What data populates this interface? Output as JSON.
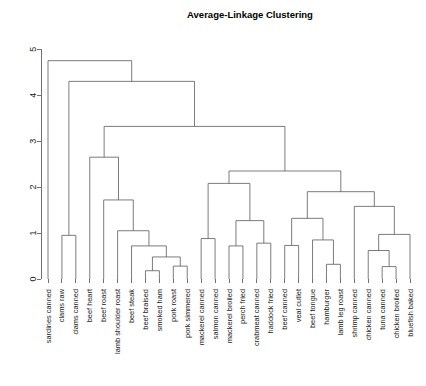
{
  "chart_data": {
    "type": "dendrogram",
    "title": "Average-Linkage Clustering",
    "xlabel": "",
    "ylabel": "",
    "ylim": [
      0,
      5.2
    ],
    "grid": false,
    "legend": "none",
    "y_ticks": [
      0,
      1,
      2,
      3,
      4,
      5
    ],
    "y_tick_labels": [
      "0",
      "1",
      "2",
      "3",
      "4",
      "5"
    ],
    "leaf_order": [
      "sardines canned",
      "clams raw",
      "clams canned",
      "beef heart",
      "beef roast",
      "lamb shoulder roast",
      "beef steak",
      "beef braised",
      "smoked ham",
      "pork roast",
      "pork simmered",
      "mackerel canned",
      "salmon canned",
      "mackerel broiled",
      "perch fried",
      "crabmeat canned",
      "haddock fried",
      "beef canned",
      "veal cutlet",
      "beef tongue",
      "hamburger",
      "lamb leg roast",
      "shrimp canned",
      "chicken canned",
      "tuna canned",
      "chicken broiled",
      "bluefish baked"
    ],
    "merges": [
      {
        "id": "m1",
        "left": {
          "leaf": 1
        },
        "right": {
          "leaf": 2
        },
        "height": 0.95
      },
      {
        "id": "m2",
        "left": {
          "leaf": 7
        },
        "right": {
          "leaf": 8
        },
        "height": 0.18
      },
      {
        "id": "m3",
        "left": {
          "leaf": 9
        },
        "right": {
          "leaf": 10
        },
        "height": 0.28
      },
      {
        "id": "m4",
        "left": {
          "node": "m2"
        },
        "right": {
          "node": "m3"
        },
        "height": 0.48
      },
      {
        "id": "m5",
        "left": {
          "leaf": 6
        },
        "right": {
          "node": "m4"
        },
        "height": 0.72
      },
      {
        "id": "m6",
        "left": {
          "leaf": 5
        },
        "right": {
          "node": "m5"
        },
        "height": 1.05
      },
      {
        "id": "m7",
        "left": {
          "leaf": 4
        },
        "right": {
          "node": "m6"
        },
        "height": 1.72
      },
      {
        "id": "m8",
        "left": {
          "leaf": 11
        },
        "right": {
          "leaf": 12
        },
        "height": 0.88
      },
      {
        "id": "m9",
        "left": {
          "leaf": 13
        },
        "right": {
          "leaf": 14
        },
        "height": 0.72
      },
      {
        "id": "m10",
        "left": {
          "leaf": 15
        },
        "right": {
          "leaf": 16
        },
        "height": 0.78
      },
      {
        "id": "m11",
        "left": {
          "node": "m9"
        },
        "right": {
          "node": "m10"
        },
        "height": 1.27
      },
      {
        "id": "m12",
        "left": {
          "node": "m8"
        },
        "right": {
          "node": "m11"
        },
        "height": 2.08
      },
      {
        "id": "m13",
        "left": {
          "leaf": 17
        },
        "right": {
          "leaf": 18
        },
        "height": 0.73
      },
      {
        "id": "m14",
        "left": {
          "leaf": 20
        },
        "right": {
          "leaf": 21
        },
        "height": 0.32
      },
      {
        "id": "m15",
        "left": {
          "leaf": 19
        },
        "right": {
          "node": "m14"
        },
        "height": 0.85
      },
      {
        "id": "m16",
        "left": {
          "node": "m13"
        },
        "right": {
          "node": "m15"
        },
        "height": 1.32
      },
      {
        "id": "m17",
        "left": {
          "leaf": 24
        },
        "right": {
          "leaf": 25
        },
        "height": 0.27
      },
      {
        "id": "m18",
        "left": {
          "leaf": 23
        },
        "right": {
          "node": "m17"
        },
        "height": 0.62
      },
      {
        "id": "m19",
        "left": {
          "leaf": 26
        },
        "right": {
          "node": "m18"
        },
        "height": 0.97
      },
      {
        "id": "m20",
        "left": {
          "leaf": 22
        },
        "right": {
          "node": "m19"
        },
        "height": 1.58
      },
      {
        "id": "m21",
        "left": {
          "node": "m16"
        },
        "right": {
          "node": "m20"
        },
        "height": 1.9
      },
      {
        "id": "m22",
        "left": {
          "node": "m12"
        },
        "right": {
          "node": "m21"
        },
        "height": 2.35
      },
      {
        "id": "m23",
        "left": {
          "leaf": 3
        },
        "right": {
          "node": "m7"
        },
        "height": 2.65
      },
      {
        "id": "m24",
        "left": {
          "node": "m23"
        },
        "right": {
          "node": "m22"
        },
        "height": 3.32
      },
      {
        "id": "m25",
        "left": {
          "node": "m1"
        },
        "right": {
          "node": "m24"
        },
        "height": 4.3
      },
      {
        "id": "m26",
        "left": {
          "leaf": 0
        },
        "right": {
          "node": "m25"
        },
        "height": 4.75
      }
    ]
  },
  "layout": {
    "plot_left": 48,
    "plot_right": 410,
    "baseline_y": 279,
    "top_y": 40,
    "title_x": 250,
    "title_y": 18,
    "label_gap": 6,
    "tick_len": 4,
    "axis_x": 41
  }
}
